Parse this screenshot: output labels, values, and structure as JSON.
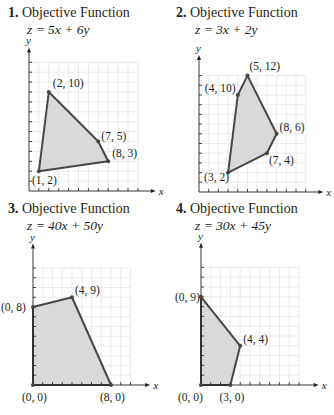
{
  "problems": [
    {
      "number": "1.",
      "title": "Objective Function",
      "formula": "z = 5x + 6y",
      "axes": {
        "x": "x",
        "y": "y"
      },
      "vertices": [
        {
          "x": 2,
          "y": 10,
          "label": "(2, 10)"
        },
        {
          "x": 7,
          "y": 5,
          "label": "(7, 5)"
        },
        {
          "x": 8,
          "y": 3,
          "label": "(8, 3)"
        },
        {
          "x": 1,
          "y": 2,
          "label": "(1, 2)"
        }
      ]
    },
    {
      "number": "2.",
      "title": "Objective Function",
      "formula": "z = 3x + 2y",
      "axes": {
        "x": "x",
        "y": "y"
      },
      "vertices": [
        {
          "x": 5,
          "y": 12,
          "label": "(5, 12)"
        },
        {
          "x": 8,
          "y": 6,
          "label": "(8, 6)"
        },
        {
          "x": 7,
          "y": 4,
          "label": "(7, 4)"
        },
        {
          "x": 3,
          "y": 2,
          "label": "(3, 2)"
        },
        {
          "x": 4,
          "y": 10,
          "label": "(4, 10)"
        }
      ]
    },
    {
      "number": "3.",
      "title": "Objective Function",
      "formula": "z = 40x + 50y",
      "axes": {
        "x": "x",
        "y": "y"
      },
      "vertices": [
        {
          "x": 0,
          "y": 8,
          "label": "(0, 8)"
        },
        {
          "x": 4,
          "y": 9,
          "label": "(4, 9)"
        },
        {
          "x": 8,
          "y": 0,
          "label": "(8, 0)"
        },
        {
          "x": 0,
          "y": 0,
          "label": "(0, 0)"
        }
      ]
    },
    {
      "number": "4.",
      "title": "Objective Function",
      "formula": "z = 30x + 45y",
      "axes": {
        "x": "x",
        "y": "y"
      },
      "vertices": [
        {
          "x": 0,
          "y": 9,
          "label": "(0, 9)"
        },
        {
          "x": 4,
          "y": 4,
          "label": "(4, 4)"
        },
        {
          "x": 3,
          "y": 0,
          "label": "(3, 0)"
        },
        {
          "x": 0,
          "y": 0,
          "label": "(0, 0)"
        }
      ]
    }
  ],
  "colors": {
    "region_fill": "#d9d9da",
    "edge": "#4a4546",
    "grid": "#e3e3e3",
    "axis": "#231f20"
  }
}
